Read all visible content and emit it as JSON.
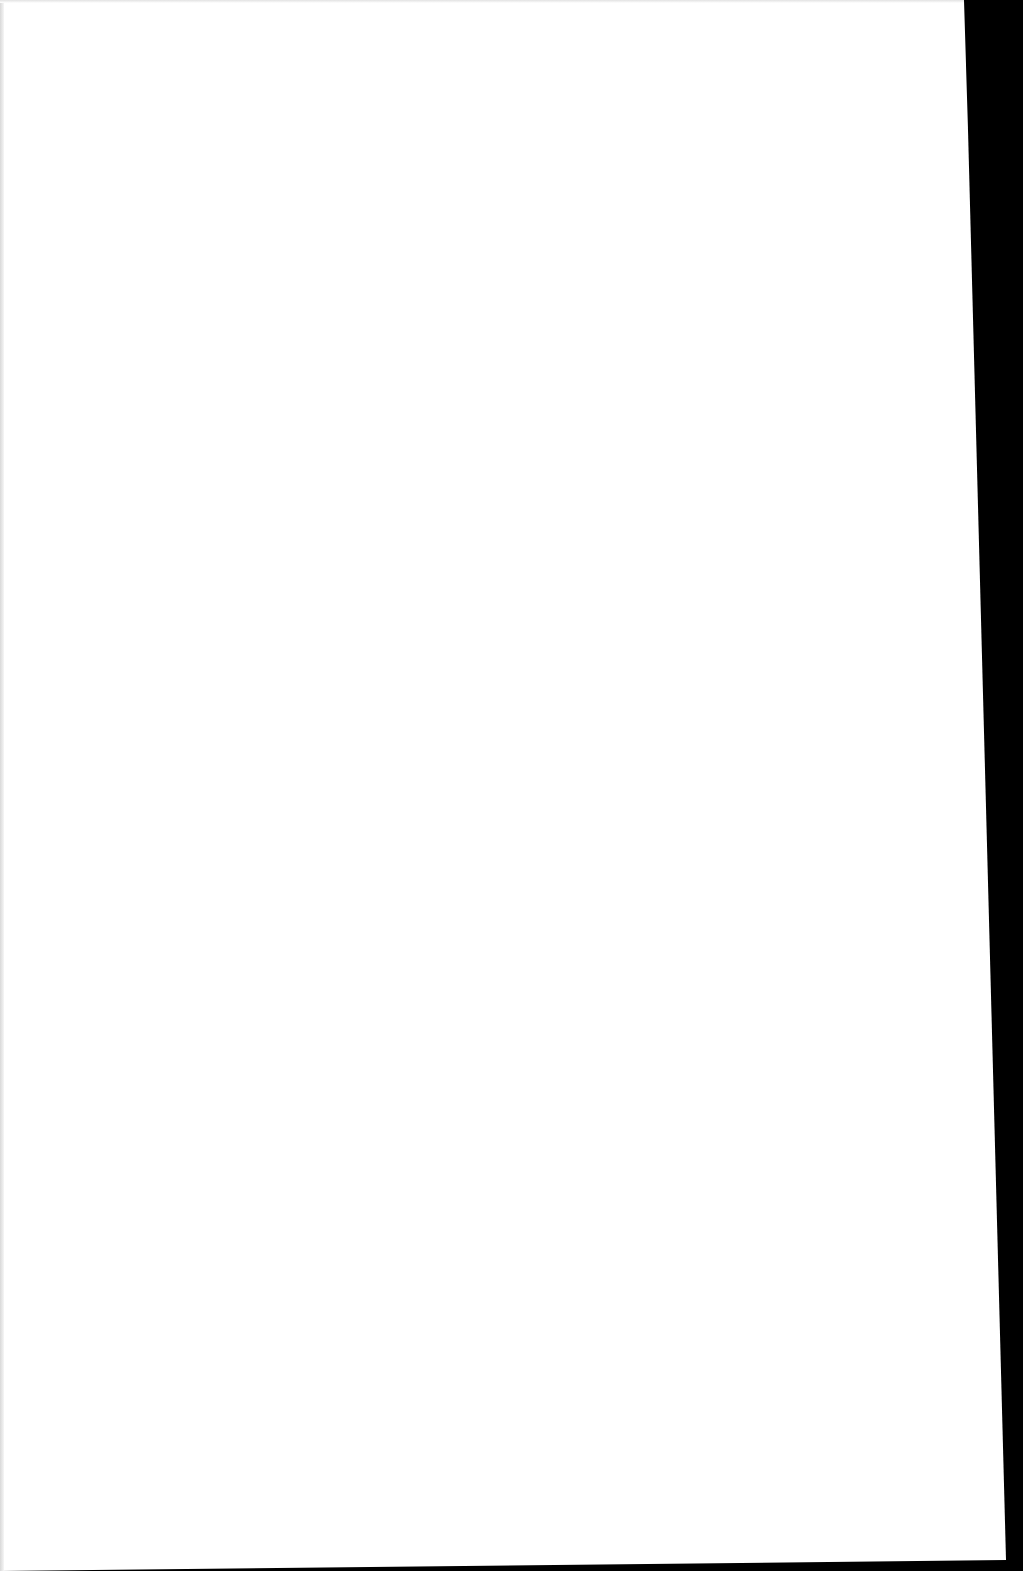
{
  "document": {
    "type": "scanned-page",
    "content": "",
    "colors": {
      "paper": "#ffffff",
      "background": "#000000"
    }
  }
}
